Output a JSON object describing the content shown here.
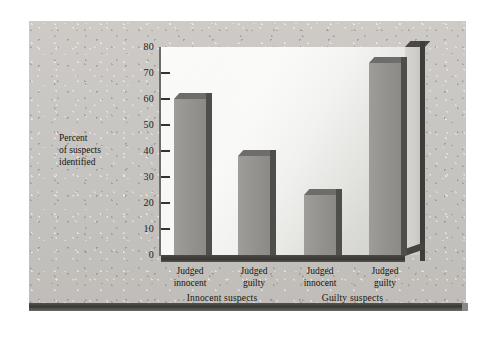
{
  "chart_data": {
    "type": "bar",
    "title": "",
    "subtitle": "",
    "xlabel": "",
    "ylabel": "Percent of suspects identified",
    "ylim": [
      0,
      80
    ],
    "yticks": [
      0,
      10,
      20,
      30,
      40,
      50,
      60,
      70,
      80
    ],
    "ytick_labels": [
      "0",
      "10",
      "20",
      "30",
      "40",
      "50",
      "60",
      "70",
      "80"
    ],
    "grid": false,
    "legend": null,
    "categories": [
      "Judged innocent",
      "Judged guilty",
      "Judged innocent",
      "Judged guilty"
    ],
    "values": [
      60,
      38,
      23,
      74
    ],
    "groups": [
      {
        "label": "Innocent suspects",
        "categories": [
          "Judged innocent",
          "Judged guilty"
        ],
        "values": [
          60,
          38
        ]
      },
      {
        "label": "Guilty suspects",
        "categories": [
          "Judged innocent",
          "Judged guilty"
        ],
        "values": [
          23,
          74
        ]
      }
    ],
    "bar_color": "#93928e",
    "plot_background": "#f2f2f0",
    "axis_color": "#35332f"
  },
  "axis": {
    "y_title_line1": "Percent",
    "y_title_line2": "of suspects",
    "y_title_line3": "identified",
    "ticks": [
      {
        "value": 80,
        "label": "80"
      },
      {
        "value": 70,
        "label": "70"
      },
      {
        "value": 60,
        "label": "60"
      },
      {
        "value": 50,
        "label": "50"
      },
      {
        "value": 40,
        "label": "40"
      },
      {
        "value": 30,
        "label": "30"
      },
      {
        "value": 20,
        "label": "20"
      },
      {
        "value": 10,
        "label": "10"
      },
      {
        "value": 0,
        "label": "0"
      }
    ]
  },
  "bars": [
    {
      "label_line1": "Judged",
      "label_line2": "innocent",
      "value": 60
    },
    {
      "label_line1": "Judged",
      "label_line2": "guilty",
      "value": 38
    },
    {
      "label_line1": "Judged",
      "label_line2": "innocent",
      "value": 23
    },
    {
      "label_line1": "Judged",
      "label_line2": "guilty",
      "value": 74
    }
  ],
  "groups": [
    {
      "label": "Innocent suspects"
    },
    {
      "label": "Guilty suspects"
    }
  ]
}
